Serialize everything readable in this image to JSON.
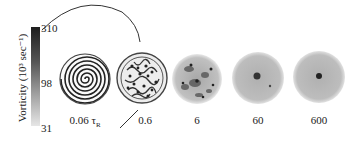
{
  "figure": {
    "colorbar": {
      "label": "Vorticity (10³ sec⁻¹)",
      "ticks": [
        "310",
        "98",
        "31"
      ]
    },
    "panels": [
      {
        "label": "0.06 τ",
        "subscript": "R",
        "pattern": "spiral"
      },
      {
        "label": "0.6",
        "pattern": "turbulent-filaments"
      },
      {
        "label": "6",
        "pattern": "diffuse-vortices"
      },
      {
        "label": "60",
        "pattern": "uniform-with-central-vortex"
      },
      {
        "label": "600",
        "pattern": "uniform-with-central-vortex"
      }
    ]
  }
}
